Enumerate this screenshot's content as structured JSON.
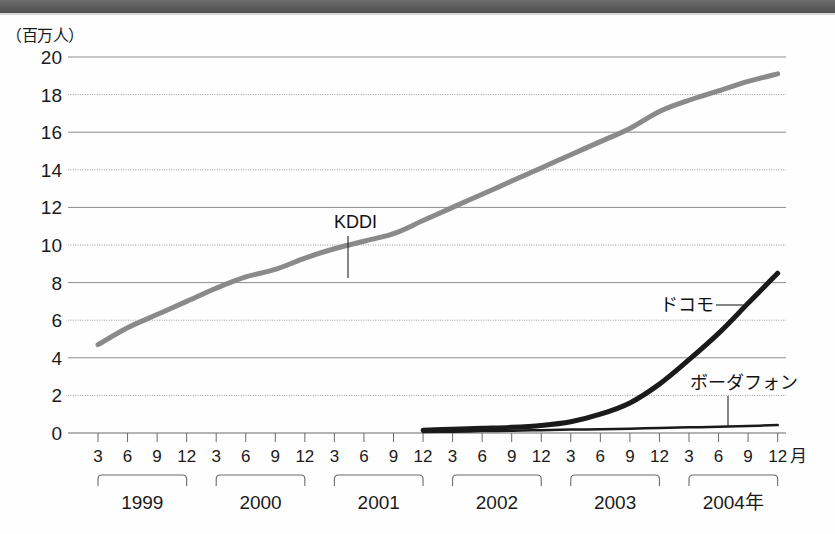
{
  "page": {
    "width": 835,
    "height": 534,
    "background": "#fefefe",
    "band_color": "#5c5c5c"
  },
  "unit_note": "（百万人）",
  "chart_data": {
    "type": "line",
    "title": "",
    "subtitle": "",
    "xlabel": "",
    "ylabel": "（百万人）",
    "ylim": [
      0,
      20
    ],
    "y_ticks": [
      0,
      2,
      4,
      6,
      8,
      10,
      12,
      14,
      16,
      18,
      20
    ],
    "y_tick_labels": [
      "0",
      "2",
      "4",
      "6",
      "8",
      "10",
      "12",
      "14",
      "16",
      "18",
      "20"
    ],
    "grid": true,
    "legend_position": "inline-annotations",
    "x_tick_labels": [
      "3",
      "6",
      "9",
      "12",
      "3",
      "6",
      "9",
      "12",
      "3",
      "6",
      "9",
      "12",
      "3",
      "6",
      "9",
      "12",
      "3",
      "6",
      "9",
      "12",
      "3",
      "6",
      "9",
      "12"
    ],
    "x_last_tick_suffix": "月",
    "x_groups": [
      {
        "label": "1999",
        "start_index": 0,
        "end_index": 3
      },
      {
        "label": "2000",
        "start_index": 4,
        "end_index": 7
      },
      {
        "label": "2001",
        "start_index": 8,
        "end_index": 11
      },
      {
        "label": "2002",
        "start_index": 12,
        "end_index": 15
      },
      {
        "label": "2003",
        "start_index": 16,
        "end_index": 19
      },
      {
        "label": "2004年",
        "start_index": 20,
        "end_index": 23
      }
    ],
    "x_periods": [
      "1999-03",
      "1999-06",
      "1999-09",
      "1999-12",
      "2000-03",
      "2000-06",
      "2000-09",
      "2000-12",
      "2001-03",
      "2001-06",
      "2001-09",
      "2001-12",
      "2002-03",
      "2002-06",
      "2002-09",
      "2002-12",
      "2003-03",
      "2003-06",
      "2003-09",
      "2003-12",
      "2004-03",
      "2004-06",
      "2004-09",
      "2004-12"
    ],
    "series": [
      {
        "name": "KDDI",
        "color": "#8a8a8a",
        "width": 5,
        "start_index": 0,
        "values": [
          4.7,
          5.6,
          6.3,
          7.0,
          7.7,
          8.3,
          8.7,
          9.3,
          9.8,
          10.2,
          10.6,
          11.3,
          12.0,
          12.7,
          13.4,
          14.1,
          14.8,
          15.5,
          16.2,
          17.1,
          17.7,
          18.2,
          18.7,
          19.1
        ]
      },
      {
        "name": "ドコモ",
        "color": "#1a1a1a",
        "width": 5,
        "start_index": 11,
        "values": [
          0.15,
          0.2,
          0.25,
          0.3,
          0.4,
          0.6,
          1.0,
          1.6,
          2.6,
          3.9,
          5.3,
          6.9,
          8.5
        ]
      },
      {
        "name": "ボーダフォン",
        "color": "#1a1a1a",
        "width": 2.5,
        "start_index": 11,
        "values": [
          0.05,
          0.07,
          0.1,
          0.12,
          0.15,
          0.18,
          0.2,
          0.23,
          0.27,
          0.3,
          0.33,
          0.37,
          0.42
        ]
      }
    ],
    "annotations": [
      {
        "text": "KDDI",
        "series": "KDDI",
        "label_x": 334,
        "label_y": 228,
        "leader_from_x": 348,
        "leader_from_y": 236,
        "leader_to_x": 348,
        "leader_to_y": 278
      },
      {
        "text": "ドコモ",
        "series": "ドコモ",
        "label_x": 660,
        "label_y": 311,
        "leader_from_x": 716,
        "leader_from_y": 305,
        "leader_to_x": 748,
        "leader_to_y": 305
      },
      {
        "text": "ボーダフォン",
        "series": "ボーダフォン",
        "label_x": 690,
        "label_y": 389,
        "leader_from_x": 728,
        "leader_from_y": 396,
        "leader_to_x": 728,
        "leader_to_y": 427
      }
    ]
  },
  "geometry": {
    "plot_left": 68,
    "plot_right": 786,
    "y_top_px": 57,
    "y_zero_px": 433,
    "x_first_tick": 98,
    "x_tick_spacing": 29.55
  }
}
